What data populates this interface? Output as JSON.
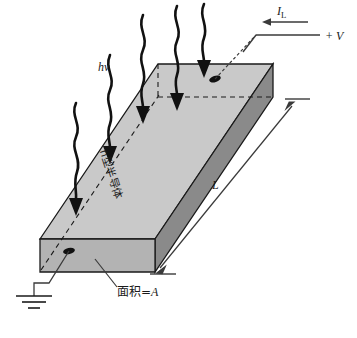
{
  "figure": {
    "colors": {
      "top_face": "#c9c9c9",
      "front_face": "#b3b3b3",
      "side_face": "#8a8a8a",
      "outline": "#1a1a1a",
      "wire": "#3a3a3a",
      "photon_arrow": "#111111",
      "background": "#ffffff"
    },
    "labels": {
      "photon_energy": "h",
      "photon_energy_nu": "ν",
      "photocurrent": "I",
      "photocurrent_sub": "L",
      "bias_voltage": "+ V",
      "length": "L",
      "area": "面积=",
      "area_symbol": "A",
      "material": "n型半导体"
    },
    "elements": {
      "photon_arrow_count": 5,
      "contact_dot_count": 2,
      "ground_symbol_bars": 3,
      "hidden_edges_style": "dashed"
    }
  }
}
